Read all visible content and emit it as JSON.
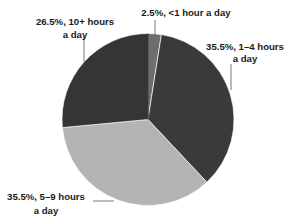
{
  "chart_data": {
    "type": "pie",
    "title": "",
    "start_angle_deg": 0,
    "direction": "clockwise",
    "slices": [
      {
        "label": "<1 hour a day",
        "value": 2.5,
        "text_line1": "2.5%, <1 hour a day",
        "text_line2": "",
        "color": "#6e6e6e"
      },
      {
        "label": "1–4 hours a day",
        "value": 35.5,
        "text_line1": "35.5%, 1–4 hours",
        "text_line2": "a day",
        "color": "#3a3a3a"
      },
      {
        "label": "5–9 hours a day",
        "value": 35.5,
        "text_line1": "35.5%, 5–9 hours",
        "text_line2": "a day",
        "color": "#b4b4b4"
      },
      {
        "label": "10+ hours a day",
        "value": 26.5,
        "text_line1": "26.5%, 10+ hours",
        "text_line2": "a day",
        "color": "#353535"
      }
    ],
    "legend": "none",
    "data_labels": "outside-with-leader-lines"
  }
}
